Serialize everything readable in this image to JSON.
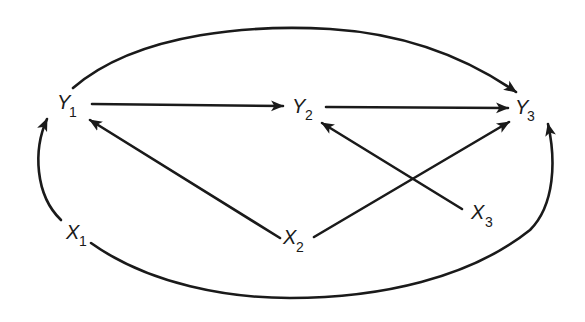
{
  "diagram": {
    "type": "path-diagram",
    "nodes": [
      {
        "id": "Y1",
        "letter": "Y",
        "sub": "1"
      },
      {
        "id": "Y2",
        "letter": "Y",
        "sub": "2"
      },
      {
        "id": "Y3",
        "letter": "Y",
        "sub": "3"
      },
      {
        "id": "X1",
        "letter": "X",
        "sub": "1"
      },
      {
        "id": "X2",
        "letter": "X",
        "sub": "2"
      },
      {
        "id": "X3",
        "letter": "X",
        "sub": "3"
      }
    ],
    "edges": [
      {
        "from": "Y1",
        "to": "Y2",
        "style": "straight"
      },
      {
        "from": "Y2",
        "to": "Y3",
        "style": "straight"
      },
      {
        "from": "Y1",
        "to": "Y3",
        "style": "curved-top"
      },
      {
        "from": "X1",
        "to": "Y1",
        "style": "curved-left"
      },
      {
        "from": "X1",
        "to": "Y3",
        "style": "curved-bottom"
      },
      {
        "from": "X2",
        "to": "Y1",
        "style": "straight"
      },
      {
        "from": "X2",
        "to": "Y3",
        "style": "straight"
      },
      {
        "from": "X3",
        "to": "Y2",
        "style": "straight"
      }
    ]
  }
}
